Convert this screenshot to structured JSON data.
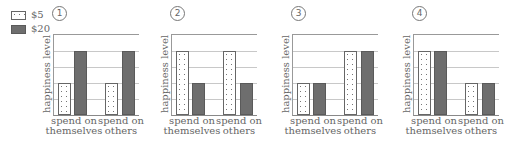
{
  "legend": [
    {
      "label": "$5",
      "pattern": "dotted",
      "color": "#ffffff"
    },
    {
      "label": "$20",
      "pattern": "solid",
      "color": "#6e6e6e"
    }
  ],
  "y_axis_label": "happiness level",
  "x_labels": [
    {
      "line1": "spend on",
      "line2": "themselves"
    },
    {
      "line1": "spend on",
      "line2": "others"
    }
  ],
  "panels": [
    {
      "number": "1",
      "title": "①"
    },
    {
      "number": "2",
      "title": "②"
    },
    {
      "number": "3",
      "title": "③"
    },
    {
      "number": "4",
      "title": "④"
    }
  ],
  "chart_data": [
    {
      "type": "bar",
      "title": "①",
      "categories": [
        "spend on themselves",
        "spend on others"
      ],
      "series": [
        {
          "name": "$5",
          "values": [
            2,
            2
          ]
        },
        {
          "name": "$20",
          "values": [
            4,
            4
          ]
        }
      ],
      "xlabel": "",
      "ylabel": "happiness level",
      "ylim": [
        0,
        5
      ],
      "grid": true,
      "legend_position": "top-left"
    },
    {
      "type": "bar",
      "title": "②",
      "categories": [
        "spend on themselves",
        "spend on others"
      ],
      "series": [
        {
          "name": "$5",
          "values": [
            4,
            4
          ]
        },
        {
          "name": "$20",
          "values": [
            2,
            2
          ]
        }
      ],
      "xlabel": "",
      "ylabel": "happiness level",
      "ylim": [
        0,
        5
      ],
      "grid": true
    },
    {
      "type": "bar",
      "title": "③",
      "categories": [
        "spend on themselves",
        "spend on others"
      ],
      "series": [
        {
          "name": "$5",
          "values": [
            2,
            4
          ]
        },
        {
          "name": "$20",
          "values": [
            2,
            4
          ]
        }
      ],
      "xlabel": "",
      "ylabel": "happiness level",
      "ylim": [
        0,
        5
      ],
      "grid": true
    },
    {
      "type": "bar",
      "title": "④",
      "categories": [
        "spend on themselves",
        "spend on others"
      ],
      "series": [
        {
          "name": "$5",
          "values": [
            4,
            2
          ]
        },
        {
          "name": "$20",
          "values": [
            4,
            2
          ]
        }
      ],
      "xlabel": "",
      "ylabel": "happiness level",
      "ylim": [
        0,
        5
      ],
      "grid": true
    }
  ]
}
